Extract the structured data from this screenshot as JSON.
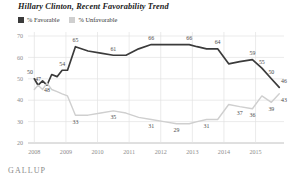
{
  "title": "Hillary Clinton, Recent Favorability Trend",
  "brand": "GALLUP",
  "legend": {
    "items": [
      {
        "label": "% Favorable",
        "color": "#3b3b3b",
        "icon": "square-swatch"
      },
      {
        "label": "% Unfavorable",
        "color": "#cfcfcf",
        "icon": "square-swatch"
      }
    ]
  },
  "chart_data": {
    "type": "line",
    "title": "Hillary Clinton, Recent Favorability Trend",
    "xlabel": "",
    "ylabel": "",
    "ylim": [
      20,
      70
    ],
    "yticks": [
      20,
      30,
      40,
      50,
      60,
      70
    ],
    "xlim": [
      2007.8,
      2015.9
    ],
    "xticks": [
      2008,
      2009,
      2010,
      2011,
      2012,
      2013,
      2014,
      2015
    ],
    "xtick_labels": [
      "2008",
      "2009",
      "2010",
      "2011",
      "2012",
      "2013",
      "2014",
      "2015"
    ],
    "grid": true,
    "legend_position": "top-left",
    "series": [
      {
        "name": "% Favorable",
        "color": "#3b3b3b",
        "x": [
          2008.0,
          2008.12,
          2008.26,
          2008.4,
          2008.55,
          2008.72,
          2008.88,
          2009.05,
          2009.3,
          2009.7,
          2010.1,
          2010.5,
          2010.9,
          2011.3,
          2011.7,
          2012.1,
          2012.5,
          2012.9,
          2013.15,
          2013.45,
          2013.8,
          2014.15,
          2014.5,
          2014.9,
          2015.2,
          2015.5,
          2015.75
        ],
        "y": [
          50,
          47,
          49,
          47,
          52,
          51,
          54,
          54,
          65,
          63,
          62,
          61,
          61,
          64,
          66,
          66,
          66,
          66,
          65,
          64,
          64,
          57,
          58,
          59,
          55,
          50,
          46
        ],
        "labels": [
          {
            "x": 2008.0,
            "y": 50,
            "text": "50"
          },
          {
            "x": 2008.12,
            "y": 47,
            "text": "47"
          },
          {
            "x": 2008.88,
            "y": 54,
            "text": "54"
          },
          {
            "x": 2009.3,
            "y": 65,
            "text": "65"
          },
          {
            "x": 2010.5,
            "y": 61,
            "text": "61"
          },
          {
            "x": 2011.7,
            "y": 66,
            "text": "66"
          },
          {
            "x": 2012.9,
            "y": 66,
            "text": "66"
          },
          {
            "x": 2013.8,
            "y": 64,
            "text": "64"
          },
          {
            "x": 2014.9,
            "y": 59,
            "text": "59"
          },
          {
            "x": 2015.2,
            "y": 55,
            "text": "55"
          },
          {
            "x": 2015.5,
            "y": 50,
            "text": "50"
          },
          {
            "x": 2015.75,
            "y": 46,
            "text": "46"
          }
        ]
      },
      {
        "name": "% Unfavorable",
        "color": "#cfcfcf",
        "x": [
          2008.0,
          2008.12,
          2008.26,
          2008.4,
          2008.55,
          2008.72,
          2008.88,
          2009.05,
          2009.3,
          2009.7,
          2010.1,
          2010.5,
          2010.9,
          2011.3,
          2011.7,
          2012.1,
          2012.5,
          2012.9,
          2013.15,
          2013.45,
          2013.8,
          2014.15,
          2014.5,
          2014.9,
          2015.2,
          2015.5,
          2015.75
        ],
        "y": [
          45,
          47,
          45,
          48,
          45,
          44,
          43,
          42,
          33,
          33,
          34,
          35,
          34,
          32,
          31,
          30,
          29,
          29,
          30,
          31,
          31,
          38,
          37,
          36,
          42,
          39,
          43
        ],
        "labels": [
          {
            "x": 2008.4,
            "y": 48,
            "text": "48"
          },
          {
            "x": 2009.3,
            "y": 33,
            "text": "33"
          },
          {
            "x": 2010.5,
            "y": 35,
            "text": "35"
          },
          {
            "x": 2011.7,
            "y": 31,
            "text": "31"
          },
          {
            "x": 2012.5,
            "y": 29,
            "text": "29"
          },
          {
            "x": 2013.45,
            "y": 31,
            "text": "31"
          },
          {
            "x": 2014.5,
            "y": 37,
            "text": "37"
          },
          {
            "x": 2014.9,
            "y": 36,
            "text": "36"
          },
          {
            "x": 2015.5,
            "y": 39,
            "text": "39"
          },
          {
            "x": 2015.75,
            "y": 43,
            "text": "43"
          }
        ]
      }
    ]
  }
}
